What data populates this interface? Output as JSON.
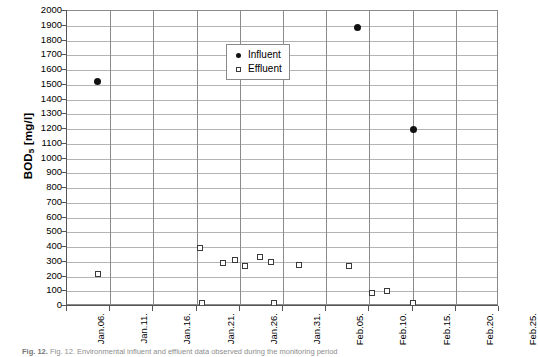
{
  "chart_data": {
    "type": "scatter",
    "title": "",
    "xlabel": "",
    "ylabel": "BOD5 [mg/l]",
    "ylabel_base": "BOD",
    "ylabel_sub": "5",
    "ylabel_unit": " [mg/l]",
    "ylim": [
      0,
      2000
    ],
    "ytick_step": 100,
    "yticks": [
      2000,
      1900,
      1800,
      1700,
      1600,
      1500,
      1400,
      1300,
      1200,
      1100,
      1000,
      900,
      800,
      700,
      600,
      500,
      400,
      300,
      200,
      100,
      0
    ],
    "xticks": [
      "Jan.06.",
      "Jan.11.",
      "Jan.16.",
      "Jan.21.",
      "Jan.26.",
      "Jan.31.",
      "Feb.05.",
      "Feb.10.",
      "Feb.15.",
      "Feb.20.",
      "Feb.25."
    ],
    "xtick_days": [
      0,
      5,
      10,
      15,
      20,
      25,
      30,
      35,
      40,
      45,
      50
    ],
    "xlim_days": [
      0,
      50
    ],
    "grid": {
      "horizontal": true,
      "vertical": true
    },
    "legend": {
      "position": "inside-top-center",
      "entries": [
        {
          "name": "Influent",
          "marker": "filled-circle",
          "color": "#111111"
        },
        {
          "name": "Effluent",
          "marker": "open-square",
          "color": "#3a3a3a"
        }
      ]
    },
    "series": [
      {
        "name": "Influent",
        "marker": "filled-circle",
        "color": "#111111",
        "points": [
          {
            "x_day": 3.5,
            "x_label": "Jan.09.",
            "y": 1520
          },
          {
            "x_day": 33.6,
            "x_label": "Feb.08.",
            "y": 1890
          },
          {
            "x_day": 40.1,
            "x_label": "Feb.15.",
            "y": 1200
          }
        ]
      },
      {
        "name": "Effluent",
        "marker": "open-square",
        "color": "#3a3a3a",
        "points": [
          {
            "x_day": 3.6,
            "x_label": "Jan.09.",
            "y": 220
          },
          {
            "x_day": 15.4,
            "x_label": "Jan.21.",
            "y": 390
          },
          {
            "x_day": 15.6,
            "x_label": "Jan.21.",
            "y": 20
          },
          {
            "x_day": 18.1,
            "x_label": "Jan.24.",
            "y": 290
          },
          {
            "x_day": 19.4,
            "x_label": "Jan.25.",
            "y": 310
          },
          {
            "x_day": 20.6,
            "x_label": "Jan.26.",
            "y": 270
          },
          {
            "x_day": 22.3,
            "x_label": "Jan.28.",
            "y": 330
          },
          {
            "x_day": 23.6,
            "x_label": "Jan.29.",
            "y": 300
          },
          {
            "x_day": 24.0,
            "x_label": "Jan.29.",
            "y": 20
          },
          {
            "x_day": 26.8,
            "x_label": "Feb.01.",
            "y": 280
          },
          {
            "x_day": 32.6,
            "x_label": "Feb.07.",
            "y": 270
          },
          {
            "x_day": 35.3,
            "x_label": "Feb.10.",
            "y": 90
          },
          {
            "x_day": 37.0,
            "x_label": "Feb.12.",
            "y": 100
          },
          {
            "x_day": 40.1,
            "x_label": "Feb.15.",
            "y": 20
          }
        ]
      }
    ]
  },
  "caption": {
    "prefix": "Fig. 12.",
    "text": "Fig. 12. Environmental influent and effluent data observed during the monitoring period"
  }
}
